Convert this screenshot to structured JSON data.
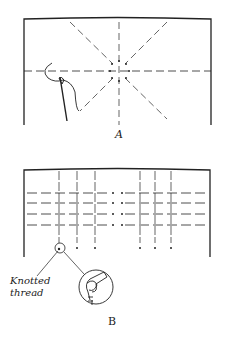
{
  "figure": {
    "panel_a": {
      "label": "A",
      "description": "Fabric with dashed radiating guide lines and a ring of dots; needle and thread at left"
    },
    "panel_b": {
      "label": "B",
      "description": "Fabric with dashed grid lines and dots; knotted thread detail circle",
      "callout_line1": "Knotted",
      "callout_line2": "thread"
    }
  },
  "colors": {
    "ink": "#222222",
    "background": "#ffffff"
  }
}
